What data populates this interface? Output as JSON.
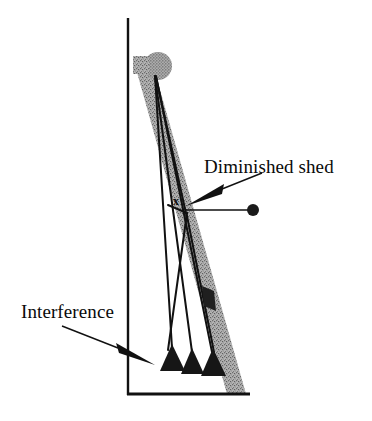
{
  "figure": {
    "background_color": "#ffffff",
    "width": 372,
    "height": 421,
    "labels": {
      "diminished_shed": "Diminished shed",
      "interference": "Interference",
      "point_x": "x"
    },
    "colors": {
      "ink": "#111111",
      "band_gray": "#8f8f8f",
      "band_gray_light": "#a8a8a8",
      "axis": "#111111",
      "marker_dark": "#1a1a1a"
    },
    "axes": {
      "vertical": {
        "x": 128,
        "y_top": 18,
        "y_bottom": 395,
        "stroke_width": 2.4
      },
      "horizontal": {
        "y": 394,
        "x_left": 128,
        "x_right": 250,
        "stroke_width": 2.8
      }
    },
    "gray_band": {
      "description": "Stippled gray inclined band (warp sheet) from upper-left to lower-right",
      "top_left_x": 133,
      "top_y": 58,
      "bottom_right_x": 246,
      "bottom_y": 394,
      "width_px": 18
    },
    "gray_ball": {
      "description": "Large gray stippled circle at top of band",
      "cx": 158,
      "cy": 66,
      "r": 14
    },
    "dark_circle_marker": {
      "description": "Small filled dark circle at right end of pointer line",
      "cx": 253,
      "cy": 210,
      "r": 6
    },
    "pointer_line": {
      "description": "Thin horizontal leader from shed apex to dark circle",
      "x1": 188,
      "y1": 210,
      "x2": 247,
      "y2": 210
    },
    "dark_rect_marker": {
      "description": "Small dark filled parallelogram on lower right warp line",
      "cx": 209,
      "cy": 299,
      "w": 12,
      "h": 22,
      "rotation_deg": 18
    },
    "apex": {
      "x": 155,
      "y": 76
    },
    "warp_lines": [
      {
        "name": "warp-line-1",
        "x1": 155,
        "y1": 76,
        "x2": 172,
        "y2": 356
      },
      {
        "name": "warp-line-2",
        "x1": 155,
        "y1": 76,
        "x2": 192,
        "y2": 360
      },
      {
        "name": "warp-line-3",
        "x1": 155,
        "y1": 76,
        "x2": 209,
        "y2": 362
      },
      {
        "name": "warp-line-4",
        "x1": 155,
        "y1": 76,
        "x2": 186,
        "y2": 218
      }
    ],
    "return_lines": [
      {
        "name": "return-line-1",
        "x1": 186,
        "y1": 214,
        "x2": 167,
        "y2": 358
      },
      {
        "name": "return-line-2",
        "x1": 186,
        "y1": 214,
        "x2": 212,
        "y2": 360
      }
    ],
    "cones": [
      {
        "name": "cone-left",
        "apex_x": 172,
        "apex_y": 346,
        "base_y": 372,
        "half_width": 12
      },
      {
        "name": "cone-middle",
        "apex_x": 192,
        "apex_y": 350,
        "base_y": 374,
        "half_width": 11
      },
      {
        "name": "cone-right",
        "apex_x": 213,
        "apex_y": 350,
        "base_y": 376,
        "half_width": 12
      }
    ],
    "arrows": [
      {
        "name": "arrow-diminished-shed",
        "from_x": 258,
        "from_y": 176,
        "to_x": 186,
        "to_y": 206,
        "style": "tapered-solid"
      },
      {
        "name": "arrow-interference",
        "from_x": 60,
        "from_y": 328,
        "to_x": 152,
        "to_y": 364,
        "style": "tapered-solid"
      }
    ]
  }
}
